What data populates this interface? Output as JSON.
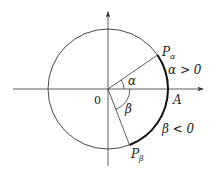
{
  "diagram": {
    "title": "",
    "origin_label": "0",
    "point_A_label": "A",
    "point_P_alpha": {
      "main": "P",
      "sub": "α"
    },
    "point_P_beta": {
      "main": "P",
      "sub": "β"
    },
    "angle_alpha_label": "α",
    "angle_beta_label": "β",
    "alpha_condition": "α > 0",
    "beta_condition": "β < 0",
    "colors": {
      "stroke": "#222222",
      "background": "#ffffff"
    }
  }
}
